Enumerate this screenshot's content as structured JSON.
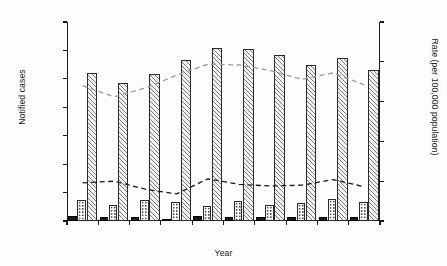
{
  "chart_data": {
    "type": "bar",
    "title": "",
    "subtitle": "",
    "xlabel": "Year",
    "ylabel": "Notified cases",
    "y2label": "Rate (per 100,000 population)",
    "categories": [
      "2006",
      "2007",
      "2008",
      "2009",
      "2010",
      "2011",
      "2012",
      "2013",
      "2014",
      "2015"
    ],
    "ylim": [
      0,
      1400
    ],
    "y2lim": [
      0,
      25
    ],
    "yticks": [
      "0",
      "200",
      "400",
      "600",
      "800",
      "1,000",
      "1,200",
      "1,400"
    ],
    "ytick_values": [
      0,
      200,
      400,
      600,
      800,
      1000,
      1200,
      1400
    ],
    "y2ticks": [
      "0",
      "5",
      "10",
      "15",
      "20",
      "25"
    ],
    "y2tick_values": [
      0,
      5,
      10,
      15,
      20,
      25
    ],
    "grid": false,
    "legend": "none",
    "series": [
      {
        "name": "black-bar-series",
        "kind": "bar",
        "fill": "solid-black",
        "axis": "left",
        "values": [
          35,
          30,
          30,
          15,
          35,
          25,
          30,
          30,
          25,
          30
        ]
      },
      {
        "name": "dotted-bar-series",
        "kind": "bar",
        "fill": "dotted",
        "axis": "left",
        "values": [
          150,
          110,
          150,
          135,
          105,
          140,
          110,
          125,
          155,
          135
        ]
      },
      {
        "name": "hatched-bar-series",
        "kind": "bar",
        "fill": "diagonal-hatch",
        "axis": "left",
        "values": [
          1040,
          970,
          1035,
          1135,
          1215,
          1210,
          1170,
          1100,
          1150,
          1060
        ]
      },
      {
        "name": "grey-dashed-rate-line",
        "kind": "line",
        "style": "dashed",
        "color": "#9a9a9a",
        "axis": "right",
        "values": [
          17.0,
          15.6,
          16.7,
          18.3,
          19.7,
          19.6,
          18.9,
          17.8,
          18.6,
          17.1
        ]
      },
      {
        "name": "black-dashed-rate-line",
        "kind": "line",
        "style": "dashed",
        "color": "#1a1a1a",
        "axis": "right",
        "values": [
          4.8,
          5.0,
          4.0,
          3.4,
          5.3,
          4.6,
          4.4,
          4.5,
          5.2,
          4.3
        ]
      }
    ]
  },
  "colors": {
    "axis": "#1a1a1a",
    "background": "#fdfdfd",
    "grey_line": "#9a9a9a",
    "black_line": "#1a1a1a",
    "hatch_fill": "#f2f2f2",
    "solid_bar": "#1b1b1b"
  }
}
